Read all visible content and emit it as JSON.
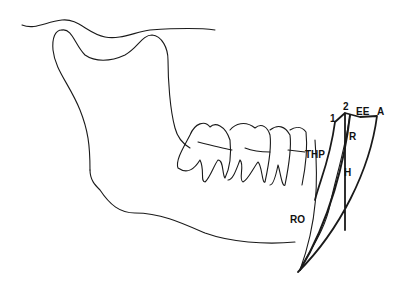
{
  "figure": {
    "stroke_color": "#1a1a1a",
    "background": "#ffffff"
  },
  "labels": {
    "one": "1",
    "two": "2",
    "ee": "EE",
    "a": "A",
    "r": "R",
    "thp": "THP",
    "h": "H",
    "ro": "RO"
  }
}
